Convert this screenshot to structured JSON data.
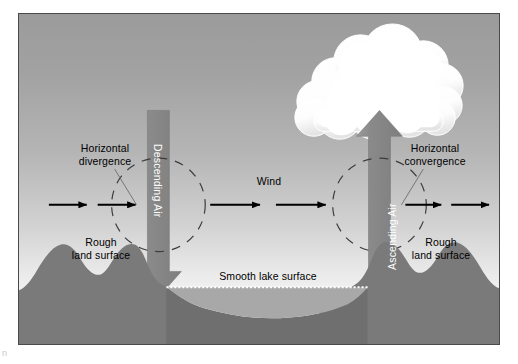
{
  "figure": {
    "title_region": "lake breeze / land-lake circulation cross-section diagram",
    "labels": {
      "horizontal_divergence": "Horizontal\ndivergence",
      "horizontal_convergence": "Horizontal\nconvergence",
      "rough_land_surface_left": "Rough\nland surface",
      "rough_land_surface_right": "Rough\nland surface",
      "smooth_lake_surface": "Smooth lake surface",
      "wind": "Wind",
      "descending_air": "Descending Air",
      "ascending_air": "Ascending Air"
    },
    "colors": {
      "sky_top": "#9b9b9b",
      "sky_bottom": "#fbfbfb",
      "land": "#7a7a7a",
      "lake_water": "#a8a8a8",
      "lake_bed": "#6f6f6f",
      "arrow_block": "#8a8a8a",
      "cloud": "#ffffff",
      "frame_border": "#4a4a4a",
      "thin_arrow": "#000000",
      "dashed_circle": "#3a3a3a"
    },
    "elements": {
      "cloud": "cumulus-cloud",
      "descending_arrow": "down-block-arrow",
      "ascending_arrow": "up-block-arrow",
      "dashed_circle_left": "dashed-circle",
      "dashed_circle_right": "dashed-circle",
      "wind_arrows": 2,
      "divergence_arrows": 2,
      "convergence_arrows": 2
    },
    "corner_mark": "n"
  }
}
